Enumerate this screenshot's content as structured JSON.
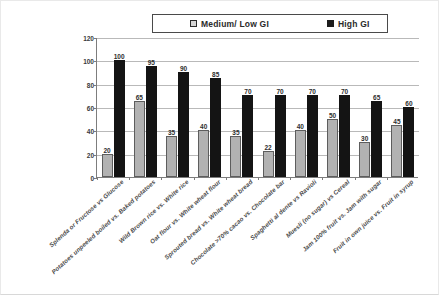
{
  "chart_data": {
    "type": "bar",
    "title": "",
    "xlabel": "",
    "ylabel": "",
    "ylim": [
      0,
      120
    ],
    "yticks": [
      0,
      20,
      40,
      60,
      80,
      100,
      120
    ],
    "grid": true,
    "legend_position": "top-center",
    "categories": [
      "Splenda or Fructose vs  Glucose",
      "Potatoes unpeeled boiled vs. Baked potatoes",
      "Wild Brown rice vs. White rice",
      "Oat flour vs. White wheat flour",
      "Sprouted bread vs. White wheat bread",
      "Chocolate >70% cacao vs. Chocolate bar",
      "Spaghetti al dente vs Ravioli",
      "Muesli (no sugar) vs Cereal",
      "Jam 100% fruit vs. Jam with sugar",
      "Fruit in own juice vs. Fruit in syrup"
    ],
    "series": [
      {
        "name": "Medium/ Low GI",
        "color": "#b2b2b2",
        "values": [
          20,
          65,
          35,
          40,
          35,
          22,
          40,
          50,
          30,
          45
        ]
      },
      {
        "name": "High GI",
        "color": "#141414",
        "values": [
          100,
          95,
          90,
          85,
          70,
          70,
          70,
          70,
          65,
          60
        ]
      }
    ]
  },
  "legend": {
    "items": [
      {
        "label": "Medium/ Low GI",
        "swatch": "medium"
      },
      {
        "label": "High GI",
        "swatch": "high"
      }
    ]
  }
}
